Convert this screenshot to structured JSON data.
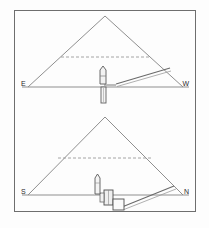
{
  "figure": {
    "background_color": "#fdfdfd",
    "border_color": "#6e6e6e",
    "line_color": "#8a8a8a",
    "structure_color": "#555555",
    "dashed_color": "#9a9a9a"
  },
  "panels": [
    {
      "id": "panel-top",
      "name": "east-west-section",
      "orientation": "E-W",
      "left_label": "E",
      "right_label": "W",
      "apex_label": "",
      "has_dashed_course_line": true,
      "features": [
        {
          "name": "ascending-passage",
          "label": ""
        },
        {
          "name": "vertical-shaft",
          "label": ""
        },
        {
          "name": "burial-chamber",
          "label": ""
        }
      ]
    },
    {
      "id": "panel-bottom",
      "name": "south-north-section",
      "orientation": "S-N",
      "left_label": "S",
      "right_label": "N",
      "apex_label": "",
      "has_dashed_course_line": true,
      "features": [
        {
          "name": "descending-passage",
          "label": ""
        },
        {
          "name": "antechamber",
          "label": ""
        },
        {
          "name": "burial-chamber",
          "label": ""
        },
        {
          "name": "vertical-shaft",
          "label": ""
        }
      ]
    }
  ],
  "geometry": {
    "frame": {
      "x": 14,
      "y": 10,
      "w": 182,
      "h": 202
    },
    "panel_top": {
      "apex": {
        "x": 105,
        "y": 16
      },
      "base_left": {
        "x": 28,
        "y": 87
      },
      "base_right": {
        "x": 183,
        "y": 87
      },
      "baseline_y": 87,
      "dashed_y": 57,
      "dashed_x1": 61,
      "dashed_x2": 150
    },
    "panel_bottom": {
      "apex": {
        "x": 105,
        "y": 117
      },
      "base_left": {
        "x": 28,
        "y": 195
      },
      "base_right": {
        "x": 183,
        "y": 195
      },
      "baseline_y": 195,
      "dashed_y": 158,
      "dashed_x1": 58,
      "dashed_x2": 152
    }
  }
}
